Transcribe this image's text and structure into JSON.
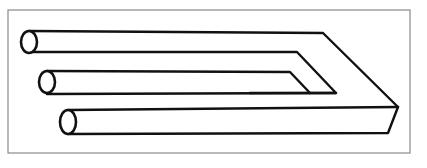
{
  "figure": {
    "colors": {
      "background": "#ffffff",
      "ink": "#111111",
      "frame": "#8a8a8a"
    },
    "frame": {
      "x": 8,
      "y": 10,
      "width": 402,
      "height": 143
    },
    "prongs": [
      {
        "id": "top",
        "end_cx": 29,
        "end_cy": 42,
        "end_rx": 8,
        "end_ry": 11,
        "top_y": 31,
        "bottom_y": 52
      },
      {
        "id": "middle",
        "end_cx": 47,
        "end_cy": 82,
        "end_rx": 8,
        "end_ry": 11,
        "top_y": 71,
        "bottom_y": 94
      },
      {
        "id": "bottom",
        "end_cx": 68,
        "end_cy": 122,
        "end_rx": 8,
        "end_ry": 12,
        "top_y": 110,
        "bottom_y": 134
      }
    ]
  }
}
